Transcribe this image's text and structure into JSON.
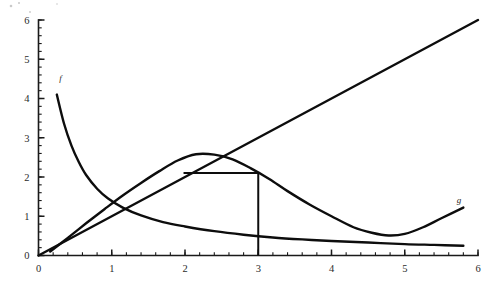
{
  "chart_data": {
    "type": "line",
    "title": "",
    "subtitle": "",
    "xlabel": "",
    "ylabel": "",
    "xlim": [
      0,
      6
    ],
    "ylim": [
      0,
      6
    ],
    "grid": false,
    "legend_position": "inline-curve-labels",
    "background_color": "#ffffff",
    "curve_color": "#0d0d0d",
    "axis_color": "#1a1a1a",
    "label_color": "#2b2b2b",
    "x_ticks": [
      0,
      1,
      2,
      3,
      4,
      5,
      6
    ],
    "x_tick_labels": [
      "0",
      "1",
      "2",
      "3",
      "4",
      "5",
      "6"
    ],
    "x_minor_step": 0.2,
    "y_ticks": [
      0,
      1,
      2,
      3,
      4,
      5,
      6
    ],
    "y_tick_labels": [
      "0",
      "1",
      "2",
      "3",
      "4",
      "5",
      "6"
    ],
    "y_minor_step": 0.2,
    "series": [
      {
        "name": "f",
        "label": "f",
        "label_x": 0.3,
        "label_y": 4.45,
        "description": "steeply decreasing convex curve",
        "points": [
          [
            0.25,
            4.1
          ],
          [
            0.35,
            3.35
          ],
          [
            0.45,
            2.8
          ],
          [
            0.55,
            2.38
          ],
          [
            0.65,
            2.05
          ],
          [
            0.8,
            1.7
          ],
          [
            0.95,
            1.45
          ],
          [
            1.15,
            1.22
          ],
          [
            1.4,
            1.02
          ],
          [
            1.7,
            0.85
          ],
          [
            2.0,
            0.74
          ],
          [
            2.4,
            0.62
          ],
          [
            2.8,
            0.53
          ],
          [
            3.2,
            0.46
          ],
          [
            3.6,
            0.41
          ],
          [
            4.0,
            0.37
          ],
          [
            4.5,
            0.33
          ],
          [
            5.0,
            0.29
          ],
          [
            5.4,
            0.27
          ],
          [
            5.8,
            0.25
          ]
        ]
      },
      {
        "name": "g",
        "label": "g",
        "label_x": 5.74,
        "label_y": 1.33,
        "description": "hump curve rising to a maximum then falling to a minimum and rising again",
        "points": [
          [
            0.16,
            0.1
          ],
          [
            0.4,
            0.45
          ],
          [
            0.65,
            0.82
          ],
          [
            0.9,
            1.18
          ],
          [
            1.15,
            1.53
          ],
          [
            1.4,
            1.85
          ],
          [
            1.65,
            2.15
          ],
          [
            1.9,
            2.42
          ],
          [
            2.15,
            2.58
          ],
          [
            2.4,
            2.57
          ],
          [
            2.65,
            2.45
          ],
          [
            2.9,
            2.22
          ],
          [
            3.15,
            1.95
          ],
          [
            3.4,
            1.64
          ],
          [
            3.7,
            1.3
          ],
          [
            4.0,
            1.0
          ],
          [
            4.3,
            0.72
          ],
          [
            4.55,
            0.58
          ],
          [
            4.78,
            0.51
          ],
          [
            5.0,
            0.55
          ],
          [
            5.25,
            0.72
          ],
          [
            5.5,
            0.95
          ],
          [
            5.8,
            1.22
          ]
        ]
      },
      {
        "name": "diagonal",
        "label": "",
        "description": "straight line through the origin with slope 1",
        "points": [
          [
            0.0,
            0.0
          ],
          [
            6.0,
            6.0
          ]
        ]
      }
    ],
    "annotations": [
      {
        "name": "vertical-drop-line",
        "type": "segment",
        "description": "vertical line at x = 3 from the x-axis up to the g curve",
        "x1": 3.0,
        "y1": 0.0,
        "x2": 3.0,
        "y2": 2.1
      },
      {
        "name": "horizontal-level-line",
        "type": "segment",
        "description": "horizontal line at y = 2.10 from the rising branch of g to x = 3",
        "x1": 1.98,
        "y1": 2.1,
        "x2": 3.0,
        "y2": 2.1
      }
    ]
  },
  "labels": {
    "f_curve": "f",
    "g_curve": "g"
  },
  "axes": {
    "x_labels": [
      "0",
      "1",
      "2",
      "3",
      "4",
      "5",
      "6"
    ],
    "y_labels": [
      "0",
      "1",
      "2",
      "3",
      "4",
      "5",
      "6"
    ]
  }
}
